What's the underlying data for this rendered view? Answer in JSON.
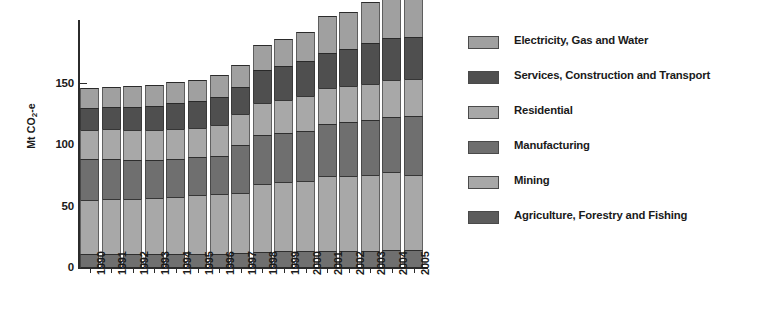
{
  "chart_data": {
    "type": "bar",
    "subtype": "stacked-bar",
    "title": "",
    "xlabel": "",
    "ylabel": "Mt CO2-e",
    "ylabel_parts": {
      "prefix": "Mt CO",
      "sub": "2",
      "suffix": "-e"
    },
    "ylim": [
      0,
      200
    ],
    "yticks": [
      0,
      50,
      100,
      150
    ],
    "ytick_labels": [
      "0",
      "50",
      "100",
      "150"
    ],
    "grid": false,
    "legend_position": "right",
    "categories": [
      "1990",
      "1991",
      "1992",
      "1993",
      "1994",
      "1995",
      "1996",
      "1997",
      "1998",
      "1999",
      "2000",
      "2001",
      "2002",
      "2003",
      "2004",
      "2005"
    ],
    "stack_order_bottom_to_top": [
      "Agriculture, Forestry and Fishing",
      "Mining",
      "Manufacturing",
      "Residential",
      "Services, Construction and Transport",
      "Electricity, Gas and Water"
    ],
    "series": [
      {
        "name": "Agriculture, Forestry and Fishing",
        "color": "#6f6f6f",
        "values": [
          11,
          11,
          11,
          11,
          11,
          11,
          11,
          12,
          13,
          14,
          14,
          14,
          14,
          14,
          15,
          15
        ]
      },
      {
        "name": "Mining",
        "color": "#a8a8a8",
        "values": [
          44,
          45,
          45,
          46,
          47,
          48,
          49,
          49,
          55,
          56,
          57,
          61,
          61,
          62,
          63,
          61
        ]
      },
      {
        "name": "Manufacturing",
        "color": "#6f6f6f",
        "values": [
          34,
          33,
          32,
          31,
          31,
          31,
          31,
          39,
          40,
          40,
          40,
          42,
          44,
          44,
          45,
          48
        ]
      },
      {
        "name": "Residential",
        "color": "#a8a8a8",
        "values": [
          23,
          24,
          24,
          24,
          24,
          24,
          25,
          25,
          26,
          27,
          29,
          29,
          29,
          30,
          30,
          30
        ]
      },
      {
        "name": "Services, Construction and Transport",
        "color": "#4f4f4f",
        "values": [
          18,
          18,
          19,
          20,
          21,
          22,
          23,
          22,
          27,
          27,
          28,
          29,
          30,
          33,
          34,
          34
        ]
      },
      {
        "name": "Electricity, Gas and Water",
        "color": "#a0a0a0",
        "values": [
          16,
          16,
          17,
          17,
          17,
          17,
          18,
          18,
          20,
          22,
          24,
          30,
          30,
          33,
          34,
          35
        ]
      }
    ],
    "totals": [
      146,
      147,
      148,
      149,
      151,
      153,
      157,
      165,
      181,
      186,
      192,
      205,
      208,
      216,
      221,
      223
    ],
    "bar_tops_value": [
      131,
      133,
      137,
      137,
      140,
      143,
      149,
      153,
      166,
      171,
      177,
      184,
      184,
      191,
      194,
      194
    ],
    "annotations": []
  },
  "legend": {
    "items": [
      {
        "label": "Electricity, Gas and Water",
        "swatch_name": "legend-swatch-electricity-gas-water",
        "color": "#a0a0a0"
      },
      {
        "label": "Services, Construction and Transport",
        "swatch_name": "legend-swatch-services-construction-transport",
        "color": "#4f4f4f"
      },
      {
        "label": "Residential",
        "swatch_name": "legend-swatch-residential",
        "color": "#a8a8a8"
      },
      {
        "label": "Manufacturing",
        "swatch_name": "legend-swatch-manufacturing",
        "color": "#6f6f6f"
      },
      {
        "label": "Mining",
        "swatch_name": "legend-swatch-mining",
        "color": "#a8a8a8"
      },
      {
        "label": "Agriculture, Forestry and Fishing",
        "swatch_name": "legend-swatch-agriculture-forestry-fishing",
        "color": "#5c5c5c"
      }
    ]
  },
  "colors": {
    "background": "#ffffff",
    "axis": "#2b2b2b",
    "text": "#1a1a1a",
    "light_gray": "#a8a8a8",
    "mid_gray": "#6f6f6f",
    "dark_gray": "#4f4f4f"
  }
}
